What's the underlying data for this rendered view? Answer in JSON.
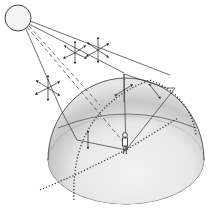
{
  "diagram": {
    "title": "Sky dome with sun and scattered skylight",
    "elements": {
      "sun": "sun",
      "sun_rays": "direct sunlight rays",
      "scatter_points": "scattering particles",
      "dome": "sky hemisphere",
      "ground": "ground plane",
      "observer": "observer"
    },
    "colors": {
      "line": "#333333",
      "dome_shade": "#d6d6d6",
      "ground": "#e4e4e4",
      "background": "#ffffff"
    }
  }
}
